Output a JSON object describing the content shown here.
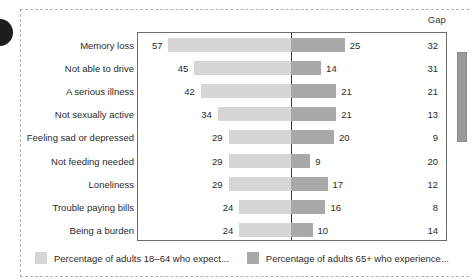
{
  "chart_data": {
    "type": "bar",
    "subtype": "diverging-bidirectional",
    "title": "",
    "xlabel": "",
    "ylabel": "",
    "grid": false,
    "legend_position": "bottom-left",
    "gap_column_header": "Gap",
    "categories": [
      "Memory loss",
      "Not able to drive",
      "A serious illness",
      "Not sexually active",
      "Feeling sad or depressed",
      "Not feeding needed",
      "Loneliness",
      "Trouble paying bills",
      "Being a burden"
    ],
    "series": [
      {
        "name": "Percentage of adults 18–64 who expect...",
        "color": "#d6d6d6",
        "direction": "left",
        "values": [
          57,
          45,
          42,
          34,
          29,
          29,
          29,
          24,
          24
        ]
      },
      {
        "name": "Percentage of adults 65+ who experience...",
        "color": "#a9a9a9",
        "direction": "right",
        "values": [
          25,
          14,
          21,
          21,
          20,
          9,
          17,
          16,
          10
        ]
      }
    ],
    "gap_values": [
      32,
      31,
      21,
      13,
      9,
      20,
      12,
      8,
      14
    ],
    "left_axis_max": 60,
    "right_axis_max": 30
  },
  "legend": {
    "items": [
      {
        "label": "Percentage of adults 18–64 who expect...",
        "color": "#d6d6d6"
      },
      {
        "label": "Percentage of adults 65+ who experience...",
        "color": "#a9a9a9"
      }
    ]
  },
  "colors": {
    "bar_light": "#d6d6d6",
    "bar_dark": "#a9a9a9",
    "plot_border": "#6e6e6e",
    "center_line": "#3a3a3a",
    "text": "#2b2b2b",
    "frame_dashed": "#b4b4b4",
    "scrollbar_thumb": "#9a9a9a"
  }
}
